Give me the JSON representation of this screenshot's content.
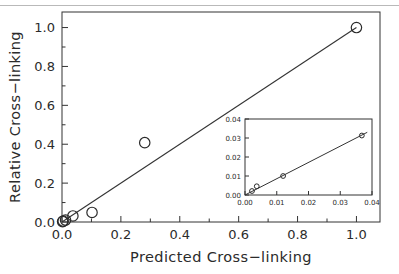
{
  "figure": {
    "background_color": "#ffffff",
    "line_color": "#333333",
    "marker_edge_color": "#2b2b2b",
    "top_rule_color": "#b9b9b9"
  },
  "chart_data": {
    "type": "scatter",
    "title": "",
    "xlabel": "Predicted Cross−linking",
    "ylabel": "Relative Cross−linking",
    "xlim": [
      0.0,
      1.08
    ],
    "ylim": [
      0.0,
      1.08
    ],
    "grid": false,
    "legend": "none",
    "marker": "open-circle",
    "xticks": [
      0.0,
      0.2,
      0.4,
      0.6,
      0.8,
      1.0
    ],
    "xtick_labels": [
      "0.0",
      "0.2",
      "0.4",
      "0.6",
      "0.8",
      "1.0"
    ],
    "yticks": [
      0.0,
      0.2,
      0.4,
      0.6,
      0.8,
      1.0
    ],
    "ytick_labels": [
      "0.0",
      "0.2",
      "0.4",
      "0.6",
      "0.8",
      "1.0"
    ],
    "minor_ticks": true,
    "points": [
      {
        "x": 0.002,
        "y": 0.002
      },
      {
        "x": 0.004,
        "y": 0.005
      },
      {
        "x": 0.012,
        "y": 0.01
      },
      {
        "x": 0.037,
        "y": 0.031
      },
      {
        "x": 0.102,
        "y": 0.049
      },
      {
        "x": 0.281,
        "y": 0.408
      },
      {
        "x": 1.0,
        "y": 1.0
      }
    ],
    "fit_line": {
      "x0": 0.0,
      "y0": 0.0,
      "x1": 1.0,
      "y1": 1.0
    },
    "inset": {
      "type": "scatter",
      "xlabel": "",
      "ylabel": "",
      "xlim": [
        0.0,
        0.04
      ],
      "ylim": [
        0.0,
        0.04
      ],
      "grid": false,
      "marker": "open-circle",
      "xticks": [
        0.0,
        0.01,
        0.02,
        0.03,
        0.04
      ],
      "xtick_labels": [
        "0.00",
        "0.01",
        "0.02",
        "0.03",
        "0.04"
      ],
      "yticks": [
        0.0,
        0.01,
        0.02,
        0.03,
        0.04
      ],
      "ytick_labels": [
        "0.00",
        "0.01",
        "0.02",
        "0.03",
        "0.04"
      ],
      "points": [
        {
          "x": 0.0022,
          "y": 0.0021
        },
        {
          "x": 0.0037,
          "y": 0.0046
        },
        {
          "x": 0.012,
          "y": 0.01
        },
        {
          "x": 0.0368,
          "y": 0.0313
        }
      ],
      "fit_line": {
        "x0": 0.0,
        "y0": 0.0,
        "x1": 0.0385,
        "y1": 0.033
      }
    }
  }
}
